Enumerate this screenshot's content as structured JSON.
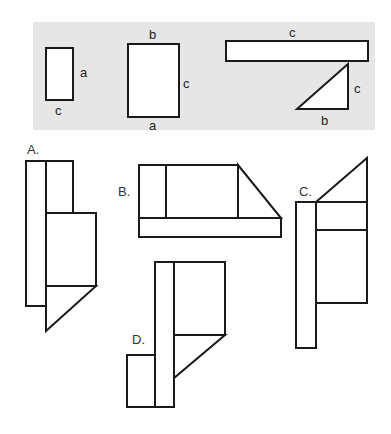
{
  "colors": {
    "panel_background": "#e6e6e6",
    "stroke": "#1a1a1a",
    "shape_fill": "#ffffff",
    "text": "#222222"
  },
  "given_pieces": {
    "rect_small": {
      "side_label": "a",
      "bottom_label": "c"
    },
    "rect_large": {
      "top_label": "b",
      "side_label": "c",
      "bottom_label": "a"
    },
    "rect_long": {
      "top_label": "c"
    },
    "triangle": {
      "side_label": "c",
      "bottom_label": "b"
    }
  },
  "options": [
    {
      "id": "A",
      "label": "A."
    },
    {
      "id": "B",
      "label": "B."
    },
    {
      "id": "C",
      "label": "C."
    },
    {
      "id": "D",
      "label": "D."
    }
  ]
}
